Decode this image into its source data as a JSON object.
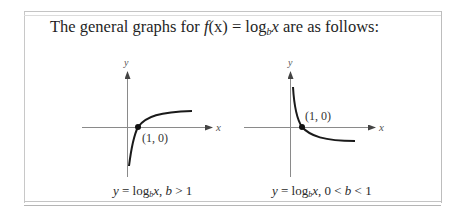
{
  "intro": {
    "prefix": "The general graphs for ",
    "func": "f",
    "func_arg": "(x)",
    "equals": " = log",
    "base": "b",
    "var": "x",
    "suffix": " are as follows:"
  },
  "graphs": [
    {
      "id": "b-greater-than-1",
      "y_axis_label": "y",
      "x_axis_label": "x",
      "point_label": "(1, 0)",
      "caption": {
        "y": "y",
        "eq": " = log",
        "base": "b",
        "var": "x",
        "condition_sep": ", ",
        "condition_var": "b",
        "condition": " > 1"
      }
    },
    {
      "id": "b-between-0-and-1",
      "y_axis_label": "y",
      "x_axis_label": "x",
      "point_label": "(1, 0)",
      "caption": {
        "y": "y",
        "eq": " = log",
        "base": "b",
        "var": "x",
        "condition_sep": ", 0 < ",
        "condition_var": "b",
        "condition": " < 1"
      }
    }
  ],
  "colors": {
    "text": "#222222",
    "axis": "#8a8a8a",
    "curve": "#1a1a1a",
    "border": "#c4c4c4"
  }
}
